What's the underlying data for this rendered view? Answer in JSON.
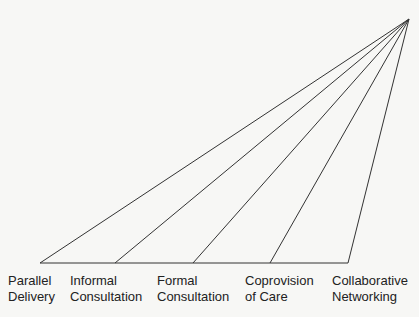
{
  "diagram": {
    "apex": {
      "x": 409,
      "y": 19
    },
    "baseline_y": 263,
    "stroke_color": "#333333",
    "categories": [
      {
        "line1": "Parallel",
        "line2": "Delivery",
        "x": 40,
        "label_x": 8
      },
      {
        "line1": "Informal",
        "line2": "Consultation",
        "x": 115,
        "label_x": 70
      },
      {
        "line1": "Formal",
        "line2": "Consultation",
        "x": 193,
        "label_x": 157
      },
      {
        "line1": "Coprovision",
        "line2": "of Care",
        "x": 270,
        "label_x": 245
      },
      {
        "line1": "Collaborative",
        "line2": "Networking",
        "x": 348,
        "label_x": 332
      }
    ]
  }
}
